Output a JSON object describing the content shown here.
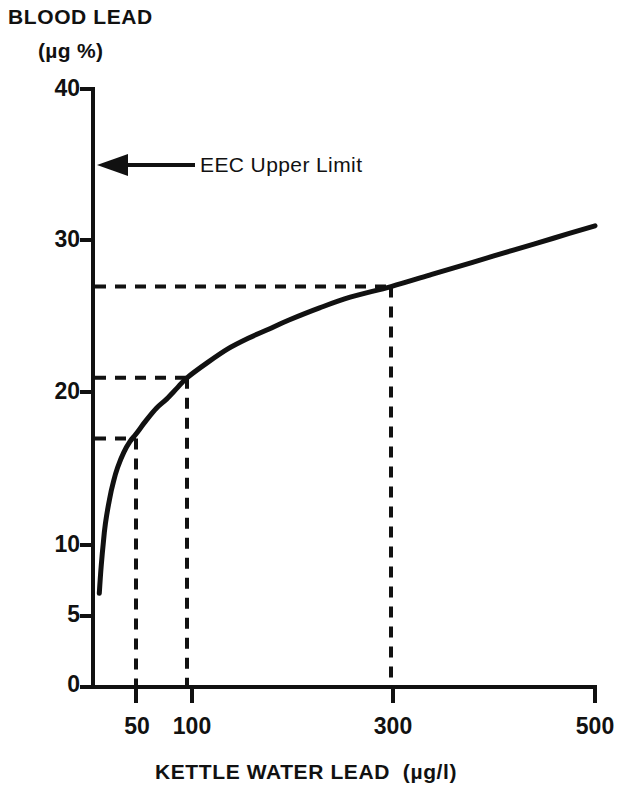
{
  "chart_data": {
    "type": "line",
    "title": "",
    "ylabel": "BLOOD LEAD",
    "ylabel_units": "(µg %)",
    "xlabel": "KETTLE WATER LEAD  (µg/l)",
    "xlabel_main": "KETTLE WATER LEAD",
    "xlabel_units": "(µg/l)",
    "xlim": [
      12,
      500
    ],
    "ylim": [
      0,
      40
    ],
    "x_ticks": [
      50,
      100,
      300,
      500
    ],
    "x_tick_labels": [
      "50",
      "100",
      "300",
      "500"
    ],
    "y_ticks": [
      0,
      5,
      10,
      20,
      30,
      40
    ],
    "y_tick_labels": [
      "0",
      "5",
      "10",
      "20",
      "30",
      "40"
    ],
    "grid": false,
    "legend": "none",
    "x": [
      14,
      16,
      18,
      20,
      24,
      28,
      32,
      38,
      44,
      50,
      60,
      70,
      80,
      90,
      100,
      120,
      140,
      160,
      180,
      200,
      230,
      260,
      300,
      340,
      380,
      420,
      460,
      500
    ],
    "values": [
      6.6,
      8.6,
      10.2,
      11.4,
      13.0,
      14.2,
      15.1,
      16.1,
      16.8,
      17.3,
      18.2,
      19.0,
      19.6,
      20.3,
      21.0,
      22.0,
      22.9,
      23.6,
      24.2,
      24.8,
      25.6,
      26.3,
      27.0,
      27.8,
      28.6,
      29.4,
      30.2,
      31.0
    ],
    "series": [
      {
        "name": "Blood lead vs kettle water lead",
        "values": [
          6.6,
          8.6,
          10.2,
          11.4,
          13.0,
          14.2,
          15.1,
          16.1,
          16.8,
          17.3,
          18.2,
          19.0,
          19.6,
          20.3,
          21.0,
          22.0,
          22.9,
          23.6,
          24.2,
          24.8,
          25.6,
          26.3,
          27.0,
          27.8,
          28.6,
          29.4,
          30.2,
          31.0
        ]
      }
    ],
    "guide_points": [
      {
        "x": 50,
        "y": 17,
        "x_label": "50",
        "y_label": "17"
      },
      {
        "x": 100,
        "y": 21,
        "x_label": "100",
        "y_label": "21"
      },
      {
        "x": 300,
        "y": 27,
        "x_label": "300",
        "y_label": "27"
      }
    ],
    "annotations": [
      {
        "name": "eec-upper-limit",
        "text": "EEC Upper Limit",
        "y_value": 35,
        "arrow": "left"
      }
    ]
  },
  "colors": {
    "ink": "#111111",
    "background": "#ffffff"
  }
}
